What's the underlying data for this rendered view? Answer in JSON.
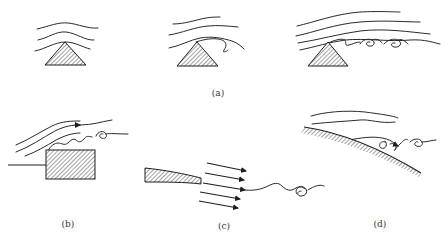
{
  "figure": {
    "colors": {
      "ink": "#2a2a2a",
      "hatch": "#555555",
      "background": "#ffffff"
    },
    "panels": [
      {
        "id": "a",
        "label": "(a)",
        "content": "Flow over a triangular ridge at three stages: attached streamlines, onset of separation, and a train of shed vortices"
      },
      {
        "id": "b",
        "label": "(b)",
        "content": "Flow over a forward-facing step with separation and a rolled-up vortex"
      },
      {
        "id": "c",
        "label": "(c)",
        "content": "Flow leaving the trailing edge of a tapered plate with parallel velocity arrows and a wavy wake ending in a vortex"
      },
      {
        "id": "d",
        "label": "(d)",
        "content": "Flow along a curved surface with separation and vortex formation"
      }
    ]
  }
}
